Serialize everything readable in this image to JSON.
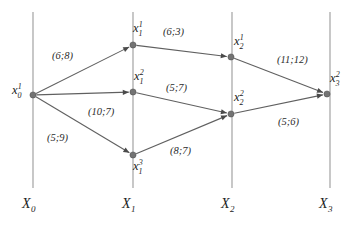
{
  "diagram": {
    "type": "layered-network-graph",
    "background_color": "#ffffff",
    "node_color": "#737373",
    "edge_color": "#606060",
    "layer_line_color": "#9a9a9a",
    "label_color": "#1c1c1c",
    "weight_format": "(a;b)",
    "layers": [
      {
        "id": "X0",
        "base": "X",
        "sub": "0",
        "x": 33
      },
      {
        "id": "X1",
        "base": "X",
        "sub": "1",
        "x": 133
      },
      {
        "id": "X2",
        "base": "X",
        "sub": "2",
        "x": 232
      },
      {
        "id": "X3",
        "base": "X",
        "sub": "3",
        "x": 330
      }
    ],
    "nodes": [
      {
        "id": "x0_1",
        "base": "x",
        "sup": "1",
        "sub": "0",
        "x": 33,
        "y": 95,
        "label_x": 12,
        "label_y": 84
      },
      {
        "id": "x1_1",
        "base": "x",
        "sup": "1",
        "sub": "1",
        "x": 133,
        "y": 45,
        "label_x": 133,
        "label_y": 22
      },
      {
        "id": "x1_2",
        "base": "x",
        "sup": "2",
        "sub": "1",
        "x": 133,
        "y": 92,
        "label_x": 134,
        "label_y": 70
      },
      {
        "id": "x1_3",
        "base": "x",
        "sup": "3",
        "sub": "1",
        "x": 133,
        "y": 155,
        "label_x": 133,
        "label_y": 160
      },
      {
        "id": "x2_1",
        "base": "x",
        "sup": "1",
        "sub": "2",
        "x": 231,
        "y": 57,
        "label_x": 234,
        "label_y": 35
      },
      {
        "id": "x2_2",
        "base": "x",
        "sup": "2",
        "sub": "2",
        "x": 231,
        "y": 114,
        "label_x": 234,
        "label_y": 91
      },
      {
        "id": "x3_2",
        "base": "x",
        "sup": "2",
        "sub": "3",
        "x": 327,
        "y": 94,
        "label_x": 330,
        "label_y": 72
      }
    ],
    "edges": [
      {
        "id": "e1",
        "from": "x0_1",
        "to": "x1_1",
        "weight": "(6;8)",
        "label_x": 52,
        "label_y": 51
      },
      {
        "id": "e2",
        "from": "x0_1",
        "to": "x1_2",
        "weight": "(10;7)",
        "label_x": 88,
        "label_y": 107
      },
      {
        "id": "e3",
        "from": "x0_1",
        "to": "x1_3",
        "weight": "(5;9)",
        "label_x": 47,
        "label_y": 133
      },
      {
        "id": "e4",
        "from": "x1_1",
        "to": "x2_1",
        "weight": "(6;3)",
        "label_x": 163,
        "label_y": 27
      },
      {
        "id": "e5",
        "from": "x1_2",
        "to": "x2_2",
        "weight": "(5;7)",
        "label_x": 166,
        "label_y": 83
      },
      {
        "id": "e6",
        "from": "x1_3",
        "to": "x2_2",
        "weight": "(8;7)",
        "label_x": 170,
        "label_y": 146
      },
      {
        "id": "e7",
        "from": "x2_1",
        "to": "x3_2",
        "weight": "(11;12)",
        "label_x": 277,
        "label_y": 55
      },
      {
        "id": "e8",
        "from": "x2_2",
        "to": "x3_2",
        "weight": "(5;6)",
        "label_x": 278,
        "label_y": 117
      }
    ],
    "layer_line_top": 12,
    "layer_line_bottom": 188,
    "axis_label_y": 197
  }
}
